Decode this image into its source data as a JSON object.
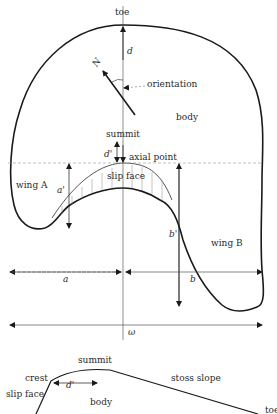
{
  "planform": {
    "labels": {
      "toe": "toe",
      "d": "d",
      "north": "N",
      "orientation": "orientation",
      "body": "body",
      "summit": "summit",
      "d_prime": "d'",
      "axial_point": "axial point",
      "slip_face": "slip face",
      "wing_a": "wing A",
      "a_prime": "a'",
      "b_prime": "b'",
      "wing_b": "wing B",
      "a": "a",
      "b": "b",
      "omega": "ω"
    }
  },
  "profile": {
    "labels": {
      "summit": "summit",
      "crest": "crest",
      "d_prime": "d'",
      "stoss_slope": "stoss slope",
      "slip_face": "slip face",
      "body": "body",
      "toe": "toe"
    }
  },
  "colors": {
    "line": "#1a1a1a",
    "thin_line": "#444444",
    "text": "#2a2a2a",
    "background": "#ffffff"
  }
}
